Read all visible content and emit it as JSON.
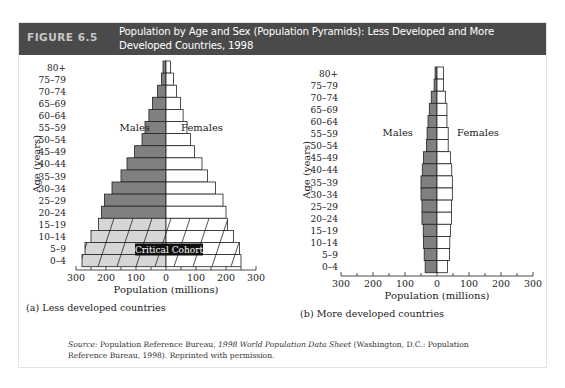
{
  "header": {
    "figure_label": "FIGURE 6.5",
    "title": "Population by Age and Sex (Population Pyramids): Less Developed and More Developed Countries, 1998"
  },
  "colors": {
    "header_bg": "#4a4a4a",
    "male_fill": "#808080",
    "female_fill": "#ffffff",
    "critical_male_fill": "#d6d6d6",
    "critical_label_bg": "#111111"
  },
  "chart_data": [
    {
      "type": "bar",
      "subtype": "population-pyramid",
      "caption": "(a) Less developed countries",
      "xlabel": "Population (millions)",
      "ylabel": "Age (years)",
      "xlim": [
        -300,
        300
      ],
      "xticks": [
        "300",
        "200",
        "100",
        "0",
        "100",
        "200",
        "300"
      ],
      "legend": {
        "left": "Males",
        "right": "Females"
      },
      "annotation": "Critical Cohort",
      "annotation_rows": [
        "0-4",
        "5-9",
        "10-14",
        "15-19"
      ],
      "categories": [
        "80+",
        "75–79",
        "70–74",
        "65–69",
        "60–64",
        "55–59",
        "50–54",
        "45–49",
        "40–44",
        "35–39",
        "30–34",
        "25–29",
        "20–24",
        "15–19",
        "10–14",
        "5–9",
        "0–4"
      ],
      "series": [
        {
          "name": "Males",
          "values": [
            10,
            15,
            28,
            45,
            57,
            70,
            80,
            105,
            130,
            150,
            180,
            205,
            215,
            225,
            250,
            270,
            280
          ]
        },
        {
          "name": "Females",
          "values": [
            15,
            25,
            35,
            48,
            57,
            70,
            82,
            95,
            120,
            138,
            165,
            190,
            200,
            205,
            225,
            245,
            250
          ]
        }
      ]
    },
    {
      "type": "bar",
      "subtype": "population-pyramid",
      "caption": "(b) More developed countries",
      "xlabel": "Population (millions)",
      "ylabel": "Age (years)",
      "xlim": [
        -300,
        300
      ],
      "xticks": [
        "300",
        "200",
        "100",
        "0",
        "100",
        "200",
        "300"
      ],
      "legend": {
        "left": "Males",
        "right": "Females"
      },
      "categories": [
        "80+",
        "75–79",
        "70–74",
        "65–69",
        "60–64",
        "55–59",
        "50–54",
        "45–49",
        "40–44",
        "35–39",
        "30–34",
        "25–29",
        "20–24",
        "15–19",
        "10–14",
        "5–9",
        "0–4"
      ],
      "series": [
        {
          "name": "Males",
          "values": [
            6,
            9,
            18,
            24,
            28,
            31,
            33,
            42,
            46,
            50,
            50,
            47,
            47,
            43,
            42,
            40,
            37
          ]
        },
        {
          "name": "Females",
          "values": [
            20,
            20,
            26,
            31,
            31,
            35,
            35,
            42,
            46,
            48,
            48,
            45,
            45,
            42,
            40,
            39,
            33
          ]
        }
      ]
    }
  ],
  "source": {
    "label": "Source:",
    "text_before": " Population Reference Bureau, ",
    "title": "1998 World Population Data Sheet",
    "text_after": " (Washington, D.C.: Population Reference Bureau, 1998). Reprinted with permission."
  }
}
